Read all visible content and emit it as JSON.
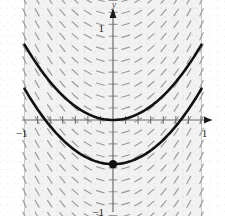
{
  "figure": {
    "kind": "slope-field-with-solution-curves",
    "background_color": "#ffffff",
    "ink_color": "#111111",
    "field_color": "#9a9a9a",
    "axis_color": "#6f6f6f",
    "shade_color": "#f2f2f2"
  },
  "axes": {
    "x_axis_label": "",
    "y_axis_label": "y",
    "origin_px": {
      "x": 113,
      "y": 120
    },
    "px_per_unit_x": 88.5,
    "px_per_unit_y": 92,
    "xlim": [
      -1.28,
      1.26
    ],
    "ylim": [
      -1.3,
      1.3
    ],
    "x_tick_labels": [
      {
        "value": -1,
        "text": "−1"
      },
      {
        "value": 1,
        "text": "1"
      }
    ],
    "y_tick_labels": [
      {
        "value": 1,
        "text": "1"
      },
      {
        "value": -1,
        "text": "−1"
      }
    ],
    "minor_tick_step": 0.142,
    "arrow_heads": [
      "x-positive",
      "y-positive"
    ]
  },
  "chart_data": {
    "type": "line",
    "title": "",
    "xlabel": "",
    "ylabel": "y",
    "xlim": [
      -1.28,
      1.26
    ],
    "ylim": [
      -1.3,
      1.3
    ],
    "grid": false,
    "legend_position": "none",
    "slope_field": {
      "equation": "dy/dx = 2x",
      "x_range": [
        -1.0,
        1.0
      ],
      "y_range": [
        -1.3,
        1.3
      ],
      "x_samples": 15,
      "y_samples": 21,
      "dash_length_px": 8,
      "color": "#9a9a9a",
      "shaded_band_x": [
        -1.0,
        1.0
      ]
    },
    "series": [
      {
        "name": "upper-solution-curve",
        "equation": "y = x^2",
        "vertex": [
          0,
          0
        ],
        "x": [
          -1.0,
          -0.75,
          -0.5,
          -0.25,
          0,
          0.25,
          0.5,
          0.75,
          1.0
        ],
        "values": [
          0.82,
          0.46,
          0.205,
          0.051,
          0.0,
          0.051,
          0.205,
          0.46,
          0.82
        ],
        "color": "#111111",
        "width_px": 2.6,
        "marked_point": null
      },
      {
        "name": "lower-solution-curve",
        "equation": "y = x^2 - 0.48",
        "vertex": [
          0,
          -0.48
        ],
        "x": [
          -1.0,
          -0.75,
          -0.5,
          -0.25,
          0,
          0.25,
          0.5,
          0.75,
          1.0
        ],
        "values": [
          0.34,
          -0.02,
          -0.275,
          -0.429,
          -0.48,
          -0.429,
          -0.275,
          -0.02,
          0.34
        ],
        "color": "#111111",
        "width_px": 2.6,
        "marked_point": [
          0,
          -0.48
        ]
      }
    ],
    "annotations": [
      {
        "name": "initial-condition-dot",
        "x": 0,
        "y": -0.48,
        "radius_px": 4.2,
        "color": "#111111"
      }
    ]
  }
}
